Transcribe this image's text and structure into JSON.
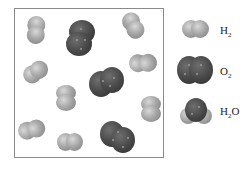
{
  "figure": {
    "box": {
      "description": "container of gas molecules"
    },
    "molecules": [
      {
        "type": "H2",
        "x": 24,
        "y": 17,
        "angle": 40
      },
      {
        "type": "O2",
        "x": 66,
        "y": 20,
        "angle": 70
      },
      {
        "type": "H2",
        "x": 120,
        "y": 14,
        "angle": 30
      },
      {
        "type": "H2",
        "x": 23,
        "y": 62,
        "angle": -20
      },
      {
        "type": "H2",
        "x": 131,
        "y": 50,
        "angle": -55
      },
      {
        "type": "O2",
        "x": 89,
        "y": 67,
        "angle": -25
      },
      {
        "type": "H2",
        "x": 55,
        "y": 85,
        "angle": 90
      },
      {
        "type": "H2",
        "x": 140,
        "y": 96,
        "angle": 90
      },
      {
        "type": "H2",
        "x": 19,
        "y": 118,
        "angle": -45
      },
      {
        "type": "H2",
        "x": 57,
        "y": 132,
        "angle": 5
      },
      {
        "type": "O2",
        "x": 100,
        "y": 121,
        "angle": 30
      }
    ]
  },
  "legend": {
    "items": [
      {
        "key": "h2",
        "main": "H",
        "sub": "2",
        "tail": ""
      },
      {
        "key": "o2",
        "main": "O",
        "sub": "2",
        "tail": ""
      },
      {
        "key": "h2o",
        "main": "H",
        "sub": "2",
        "tail": "O"
      }
    ]
  },
  "colors": {
    "hydrogen": "#a8a8a8",
    "oxygen": "#4a4a4a",
    "border": "#8a8a8a"
  }
}
